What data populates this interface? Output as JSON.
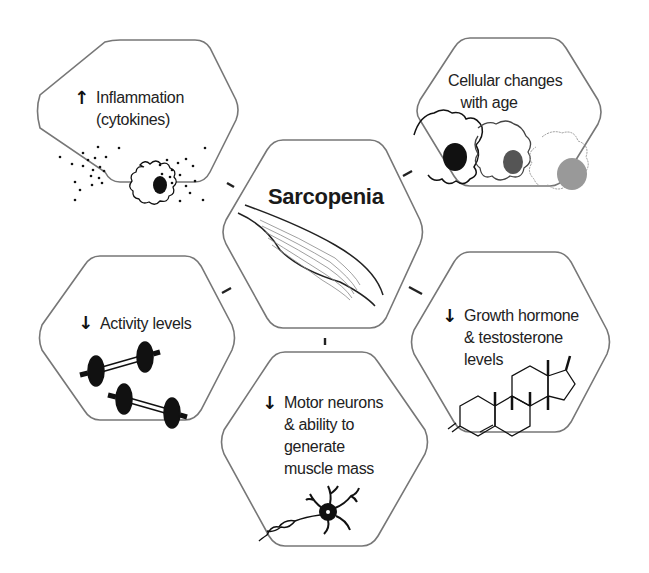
{
  "diagram": {
    "type": "hexagon-concept-map",
    "center": {
      "title": "Sarcopenia",
      "icon": "muscle-icon"
    },
    "nodes": [
      {
        "id": "inflammation",
        "direction": "up",
        "arrow": "↑",
        "label": "Inflammation\n(cytokines)",
        "icon": "inflamed-cell-icon"
      },
      {
        "id": "cellular",
        "direction": "none",
        "arrow": "",
        "label": "Cellular changes\n   with age",
        "icon": "aging-cells-icon"
      },
      {
        "id": "activity",
        "direction": "down",
        "arrow": "↓",
        "label": "Activity levels",
        "icon": "dumbbells-icon"
      },
      {
        "id": "hormones",
        "direction": "down",
        "arrow": "↓",
        "label": "Growth hormone\n& testosterone\nlevels",
        "icon": "steroid-molecule-icon"
      },
      {
        "id": "motor",
        "direction": "down",
        "arrow": "↓",
        "label": "Motor neurons\n& ability to\ngenerate\nmuscle mass",
        "icon": "neuron-icon"
      }
    ],
    "colors": {
      "outline": "#777777",
      "ink": "#111111",
      "nucleus_dark": "#111111",
      "nucleus_mid": "#555555",
      "nucleus_light": "#999999"
    }
  }
}
